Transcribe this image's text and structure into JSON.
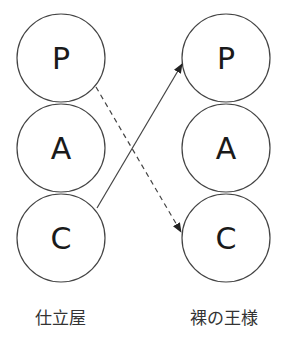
{
  "diagram": {
    "left_column": {
      "label": "仕立屋",
      "nodes": [
        "P",
        "A",
        "C"
      ]
    },
    "right_column": {
      "label": "裸の王様",
      "nodes": [
        "P",
        "A",
        "C"
      ]
    },
    "edges": [
      {
        "from": "left.C",
        "to": "right.P",
        "style": "solid"
      },
      {
        "from": "left.P",
        "to": "right.C",
        "style": "dashed"
      }
    ],
    "colors": {
      "stroke": "#444444",
      "text": "#1a1a1a"
    }
  }
}
